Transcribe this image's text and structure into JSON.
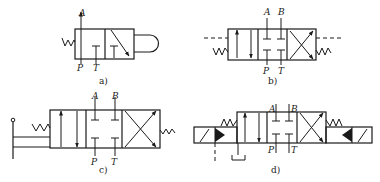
{
  "figure": {
    "colors": {
      "stroke": "#1a1a1a",
      "background": "#ffffff"
    },
    "diagrams": [
      {
        "id": "a",
        "caption": "a)",
        "type": "2-position 3-way valve, roller operated, spring return",
        "ports": {
          "A": "A",
          "P": "P",
          "T": "T"
        }
      },
      {
        "id": "b",
        "caption": "b)",
        "type": "3-position 4-way valve, spring centred, pilot/hydraulic operated (dashed lines)",
        "ports": {
          "A": "A",
          "B": "B",
          "P": "P",
          "T": "T"
        }
      },
      {
        "id": "c",
        "caption": "c)",
        "type": "3-position 4-way valve, manual lever operated, spring",
        "ports": {
          "A": "A",
          "B": "B",
          "P": "P",
          "T": "T"
        }
      },
      {
        "id": "d",
        "caption": "d)",
        "type": "3-position 4-way valve, solenoid-pilot operated, spring centred",
        "ports": {
          "A": "A",
          "B": "B",
          "P": "P",
          "T": "T"
        }
      }
    ]
  }
}
